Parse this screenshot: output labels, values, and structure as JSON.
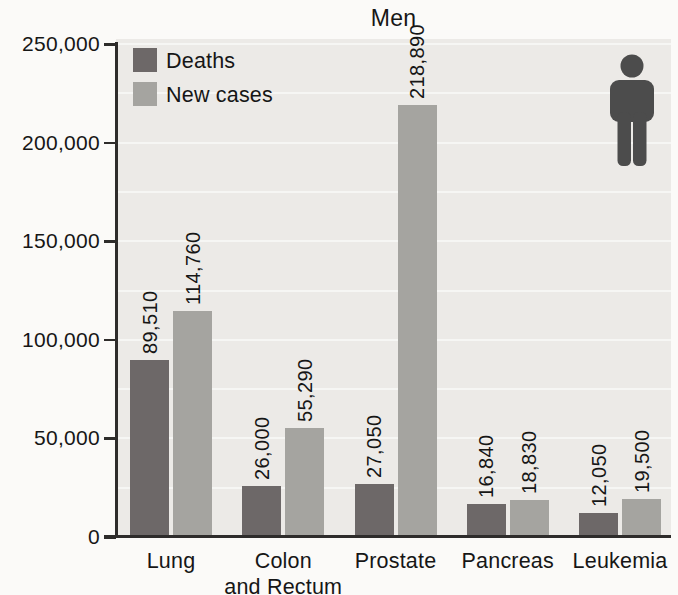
{
  "title": "Men",
  "legend": {
    "items": [
      {
        "label": "Deaths",
        "color": "#6d6868"
      },
      {
        "label": "New cases",
        "color": "#a5a4a0"
      }
    ],
    "position": "top-left"
  },
  "icons": {
    "man_icon": "male-figure-pictogram",
    "man_icon_color": "#4c4c4c"
  },
  "colors": {
    "plot_background": "#eceae7",
    "gridline": "#ffffff",
    "axis": "#2e2c2b",
    "text": "#161616",
    "deaths_bar": "#6d6868",
    "new_cases_bar": "#a5a4a0"
  },
  "chart_data": {
    "type": "bar",
    "title": "Men",
    "categories": [
      "Lung",
      "Colon and Rectum",
      "Prostate",
      "Pancreas",
      "Leukemia"
    ],
    "category_label_lines": [
      [
        "Lung"
      ],
      [
        "Colon",
        "and Rectum"
      ],
      [
        "Prostate"
      ],
      [
        "Pancreas"
      ],
      [
        "Leukemia"
      ]
    ],
    "series": [
      {
        "name": "Deaths",
        "color": "#6d6868",
        "values": [
          89510,
          26000,
          27050,
          16840,
          12050
        ],
        "value_labels": [
          "89,510",
          "26,000",
          "27,050",
          "16,840",
          "12,050"
        ]
      },
      {
        "name": "New cases",
        "color": "#a5a4a0",
        "values": [
          114760,
          55290,
          218890,
          18830,
          19500
        ],
        "value_labels": [
          "114,760",
          "55,290",
          "218,890",
          "18,830",
          "19,500"
        ]
      }
    ],
    "xlabel": "",
    "ylabel": "",
    "ylim": [
      0,
      250000
    ],
    "ytick_interval": 50000,
    "ytick_labels": [
      "0",
      "50,000",
      "100,000",
      "150,000",
      "200,000",
      "250,000"
    ],
    "grid": "faint white horizontal lines every 25,000",
    "legend_position": "top-left inside plot",
    "value_label_style": "rotated 90 degrees above each bar"
  }
}
